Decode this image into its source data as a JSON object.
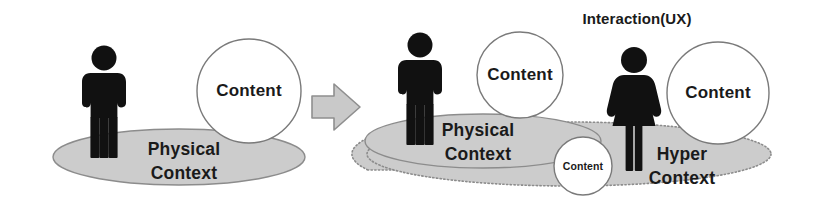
{
  "diagram": {
    "title_visible": false,
    "background_color": "#ffffff",
    "colors": {
      "figure": "#111111",
      "context_fill": "#cccccc",
      "context_stroke": "#8c8c8c",
      "circle_fill": "#ffffff",
      "circle_stroke": "#7a7a7a",
      "arrow_fill": "#c9c9c9",
      "arrow_stroke": "#8f8f8f",
      "text": "#1a1a1a"
    },
    "left_group": {
      "name": "physical-context-group",
      "context_label_line1": "Physical",
      "context_label_line2": "Context",
      "context_style": "solid",
      "figures": [
        {
          "name": "person-male",
          "gender": "male"
        }
      ],
      "content_circles": [
        {
          "label": "Content",
          "size": "large"
        }
      ]
    },
    "transition": {
      "name": "right-arrow",
      "direction": "right",
      "label": ""
    },
    "right_group": {
      "name": "hyper-context-group",
      "interaction_label": "Interaction(UX)",
      "physical_context_label_line1": "Physical",
      "physical_context_label_line2": "Context",
      "physical_context_style": "solid",
      "hyper_context_label_line1": "Hyper",
      "hyper_context_label_line2": "Context",
      "hyper_context_style": "dotted",
      "figures": [
        {
          "name": "person-male",
          "gender": "male"
        },
        {
          "name": "person-female",
          "gender": "female"
        }
      ],
      "content_circles": [
        {
          "label": "Content",
          "size": "large"
        },
        {
          "label": "Content",
          "size": "small"
        },
        {
          "label": "Content",
          "size": "large"
        }
      ]
    }
  }
}
